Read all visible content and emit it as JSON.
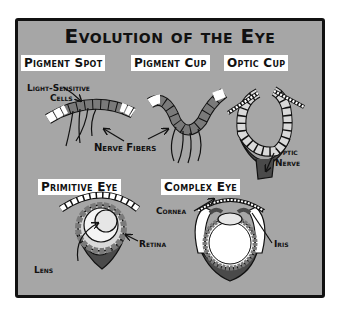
{
  "title": "Evolution of the Eye",
  "stages": [
    {
      "name": "Pigment Spot"
    },
    {
      "name": "Pigment Cup"
    },
    {
      "name": "Optic Cup"
    },
    {
      "name": "Primitive Eye"
    },
    {
      "name": "Complex Eye"
    }
  ],
  "labels": {
    "light_sensitive": "Light-Sensitive",
    "cells": "Cells",
    "nerve_fibers": "Nerve Fibers",
    "optic": "Optic",
    "nerve": "Nerve",
    "retina": "Retina",
    "lens": "Lens",
    "cornea": "Cornea",
    "iris": "Iris"
  },
  "colors": {
    "panel": "#a6a6a6",
    "frame": "#111111",
    "cell_dark": "#7a7a7a",
    "cell_light": "#d9d9d9",
    "nerve_tissue": "#4a4a4a",
    "lens": "#f0f0f0"
  }
}
